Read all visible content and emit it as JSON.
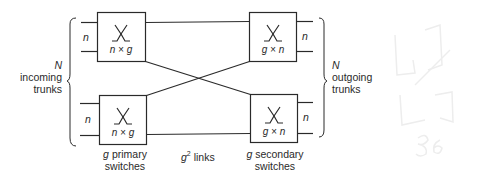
{
  "diagram": {
    "type": "two-stage switching network",
    "left_group": {
      "N_label": "N",
      "line1": "incoming",
      "line2": "trunks"
    },
    "right_group": {
      "N_label": "N",
      "line1": "outgoing",
      "line2": "trunks"
    },
    "primary_switches": [
      {
        "id": "primary-top",
        "label": "n × g",
        "input_label": "n"
      },
      {
        "id": "primary-bottom",
        "label": "n × g",
        "input_label": "n"
      }
    ],
    "secondary_switches": [
      {
        "id": "secondary-top",
        "label": "g × n",
        "output_label": "n"
      },
      {
        "id": "secondary-bottom",
        "label": "g × n",
        "output_label": "n"
      }
    ],
    "captions": {
      "primary_g": "g",
      "primary_line1": "primary",
      "primary_line2": "switches",
      "links_g": "g",
      "links_exp": "2",
      "links_text": "links",
      "secondary_g": "g",
      "secondary_line1": "secondary",
      "secondary_line2": "switches"
    },
    "stroke_color": "#2a2a2a",
    "background_sketch_color": "#ececec"
  }
}
